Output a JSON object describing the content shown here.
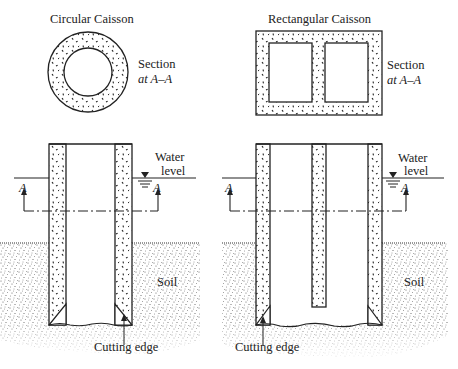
{
  "figure": {
    "type": "engineering-diagram",
    "panels": [
      {
        "id": "circular",
        "title": "Circular Caisson",
        "section_label_line1": "Section",
        "section_label_line2": "at A–A",
        "water_label_line1": "Water",
        "water_label_line2": "level",
        "section_marker": "A",
        "soil_label": "Soil",
        "cutting_edge_label": "Cutting edge"
      },
      {
        "id": "rectangular",
        "title": "Rectangular Caisson",
        "section_label_line1": "Section",
        "section_label_line2": "at A–A",
        "water_label_line1": "Water",
        "water_label_line2": "level",
        "section_marker": "A",
        "soil_label": "Soil",
        "cutting_edge_label": "Cutting edge"
      }
    ],
    "colors": {
      "line": "#222222",
      "soil_stipple": "#555555",
      "background": "#ffffff"
    }
  }
}
